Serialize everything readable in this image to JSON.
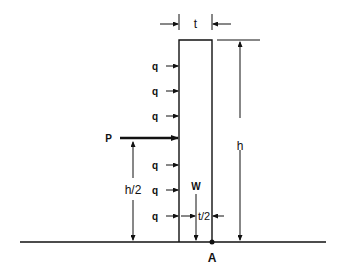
{
  "diagram": {
    "labels": {
      "thickness": "t",
      "height": "h",
      "half_height": "h/2",
      "point_load": "P",
      "weight": "W",
      "half_thickness": "t/2",
      "pivot_point": "A"
    },
    "distributed_load_label": "q",
    "distributed_load_rows": [
      66,
      91,
      116,
      165,
      190,
      215
    ],
    "colors": {
      "stroke": "#111111",
      "background": "#ffffff"
    }
  }
}
